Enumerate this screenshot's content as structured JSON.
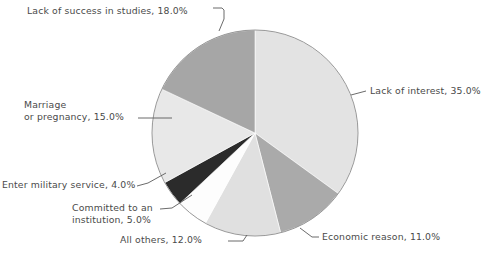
{
  "chart_data": {
    "type": "pie",
    "title": "",
    "subtitle": "",
    "xlabel": "",
    "ylabel": "",
    "legend_position": "none",
    "grid": false,
    "units": "percent",
    "categories": [
      "Lack of interest",
      "Economic reason",
      "All others",
      "Committed to an institution",
      "Enter military service",
      "Marriage or pregnancy",
      "Lack of success in studies"
    ],
    "values": [
      35.0,
      11.0,
      12.0,
      5.0,
      4.0,
      15.0,
      18.0
    ],
    "slices": [
      {
        "key": "lack-interest",
        "label": "Lack of interest",
        "value": 35.0,
        "value_text": "35.0%",
        "label_text": "Lack of interest, 35.0%",
        "color": "#e3e3e3",
        "start_deg": 0.0,
        "end_deg": 126.0
      },
      {
        "key": "economic",
        "label": "Economic reason",
        "value": 11.0,
        "value_text": "11.0%",
        "label_text": "Economic reason, 11.0%",
        "color": "#aaaaaa",
        "start_deg": 126.0,
        "end_deg": 165.6
      },
      {
        "key": "all-others",
        "label": "All others",
        "value": 12.0,
        "value_text": "12.0%",
        "label_text": "All others, 12.0%",
        "color": "#e0e0e0",
        "start_deg": 165.6,
        "end_deg": 208.8
      },
      {
        "key": "committed",
        "label": "Committed to an institution",
        "value": 5.0,
        "value_text": "5.0%",
        "label_text": "Committed to an\ninstitution, 5.0%",
        "color": "#fdfdfd",
        "start_deg": 208.8,
        "end_deg": 226.8
      },
      {
        "key": "military",
        "label": "Enter military service",
        "value": 4.0,
        "value_text": "4.0%",
        "label_text": "Enter military service, 4.0%",
        "color": "#2b2b2b",
        "start_deg": 226.8,
        "end_deg": 241.2
      },
      {
        "key": "marriage",
        "label": "Marriage or pregnancy",
        "value": 15.0,
        "value_text": "15.0%",
        "label_text": "Marriage\nor pregnancy, 15.0%",
        "color": "#e8e8e8",
        "start_deg": 241.2,
        "end_deg": 295.2
      },
      {
        "key": "lack-success",
        "label": "Lack of success in studies",
        "value": 18.0,
        "value_text": "18.0%",
        "label_text": "Lack of success in studies, 18.0%",
        "color": "#a6a6a6",
        "start_deg": 295.2,
        "end_deg": 360.0
      }
    ],
    "geometry": {
      "center_x": 255,
      "center_y": 133,
      "radius": 103
    },
    "style": {
      "background": "#ffffff",
      "outline": "#8c8c8c",
      "leader_line": "#5a5a5a",
      "text": "#4a4a4a"
    }
  }
}
